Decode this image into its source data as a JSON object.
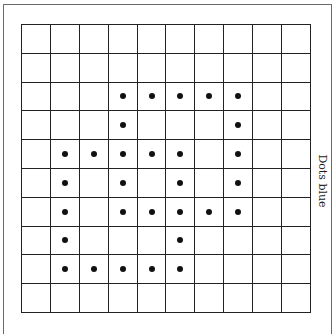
{
  "figure": {
    "label": "Dots blue",
    "grid": {
      "rows": 10,
      "cols": 10
    },
    "dot_color": "#111111",
    "dots": [
      [],
      [],
      [
        3,
        4,
        5,
        6,
        7
      ],
      [
        3,
        7
      ],
      [
        1,
        2,
        3,
        4,
        5,
        7
      ],
      [
        1,
        3,
        5,
        7
      ],
      [
        1,
        3,
        4,
        5,
        6,
        7
      ],
      [
        1,
        5
      ],
      [
        1,
        2,
        3,
        4,
        5
      ],
      []
    ]
  }
}
